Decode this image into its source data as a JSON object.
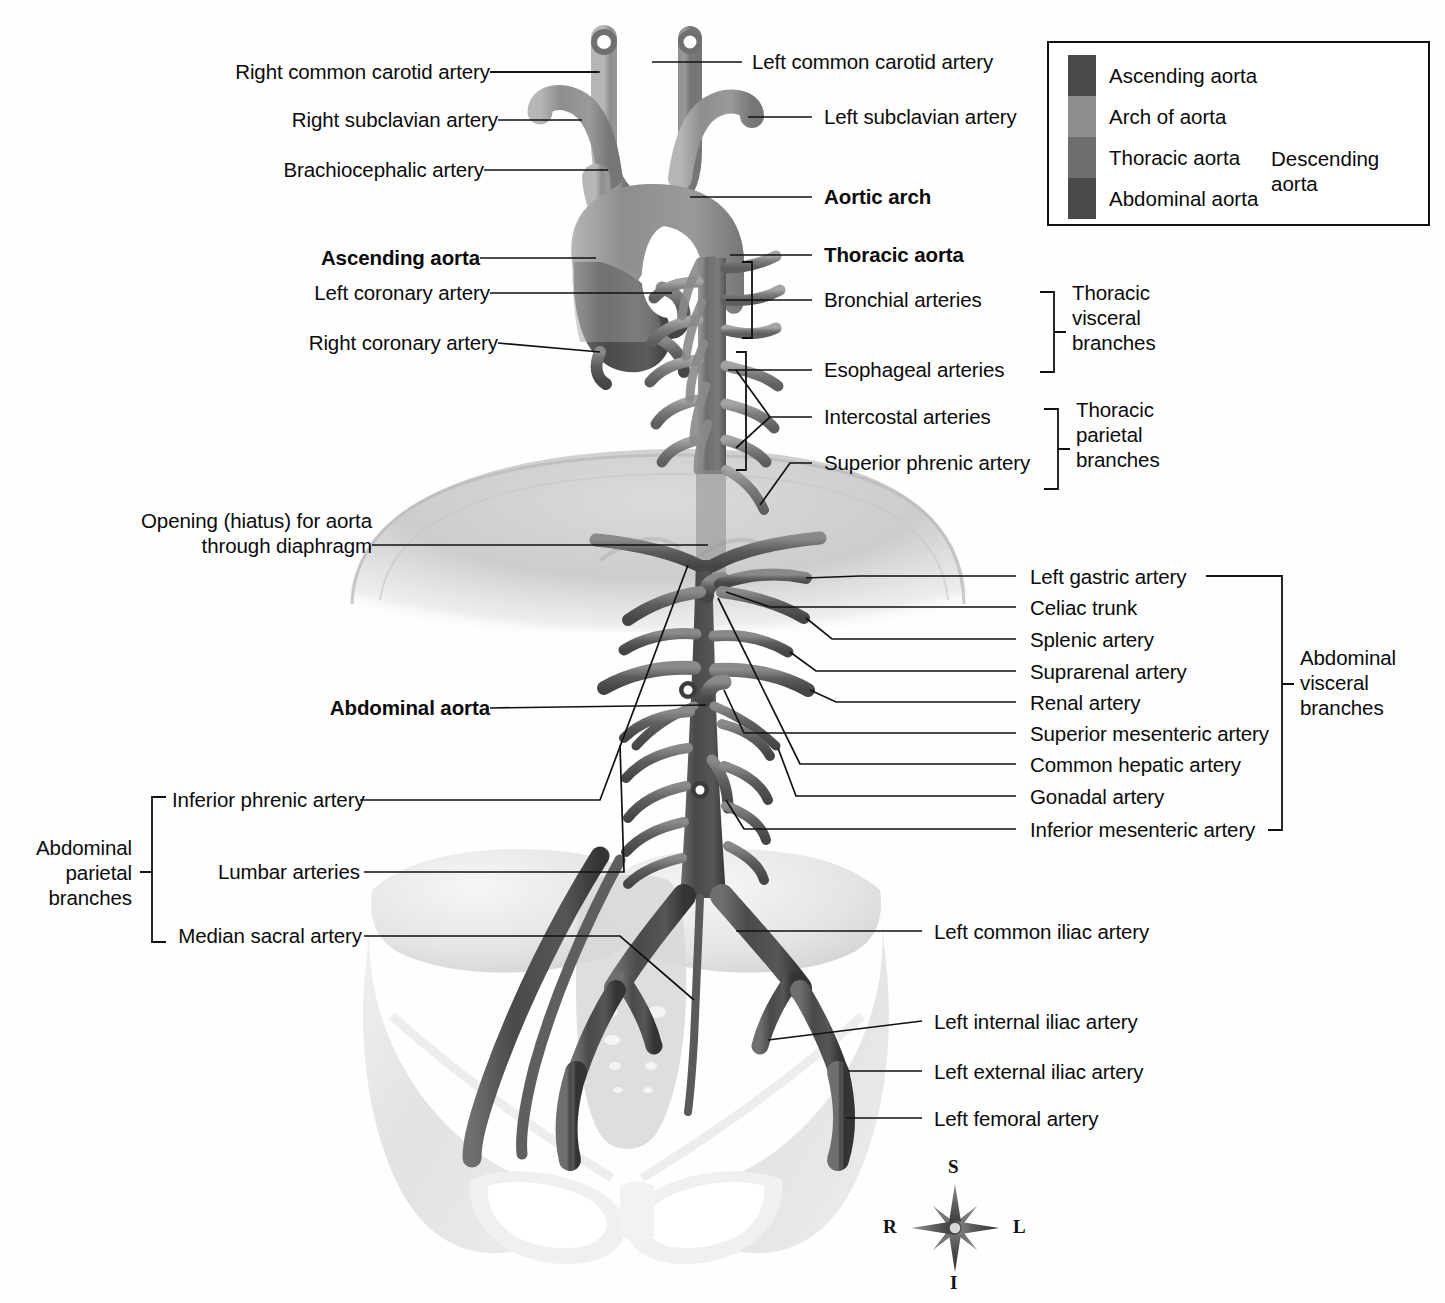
{
  "figure": {
    "background": "#fefefe",
    "ink": "#111111"
  },
  "legend": {
    "items": [
      {
        "label": "Ascending aorta",
        "color": "#4a4a4a"
      },
      {
        "label": "Arch of aorta",
        "color": "#8e8e8e"
      },
      {
        "label": "Thoracic aorta",
        "color": "#6e6e6e"
      },
      {
        "label": "Abdominal aorta",
        "color": "#4a4a4a"
      }
    ],
    "bracket_label": "Descending\naorta",
    "bracket_label_line1": "Descending",
    "bracket_label_line2": "aorta"
  },
  "labels_left": [
    {
      "id": "right-common-carotid-artery",
      "text": "Right common carotid artery",
      "bold": false
    },
    {
      "id": "right-subclavian-artery",
      "text": "Right subclavian artery",
      "bold": false
    },
    {
      "id": "brachiocephalic-artery",
      "text": "Brachiocephalic artery",
      "bold": false
    },
    {
      "id": "ascending-aorta",
      "text": "Ascending aorta",
      "bold": true
    },
    {
      "id": "left-coronary-artery",
      "text": "Left coronary artery",
      "bold": false
    },
    {
      "id": "right-coronary-artery",
      "text": "Right coronary artery",
      "bold": false
    },
    {
      "id": "opening-hiatus-line1",
      "text": "Opening (hiatus) for aorta",
      "bold": false
    },
    {
      "id": "opening-hiatus-line2",
      "text": "through diaphragm",
      "bold": false
    },
    {
      "id": "abdominal-aorta",
      "text": "Abdominal aorta",
      "bold": true
    },
    {
      "id": "inferior-phrenic-artery",
      "text": "Inferior phrenic artery",
      "bold": false
    },
    {
      "id": "lumbar-arteries",
      "text": "Lumbar arteries",
      "bold": false
    },
    {
      "id": "median-sacral-artery",
      "text": "Median sacral artery",
      "bold": false
    }
  ],
  "labels_right": [
    {
      "id": "left-common-carotid-artery",
      "text": "Left common carotid artery",
      "bold": false
    },
    {
      "id": "left-subclavian-artery",
      "text": "Left subclavian artery",
      "bold": false
    },
    {
      "id": "aortic-arch",
      "text": "Aortic arch",
      "bold": true
    },
    {
      "id": "thoracic-aorta",
      "text": "Thoracic aorta",
      "bold": true
    },
    {
      "id": "bronchial-arteries",
      "text": "Bronchial arteries",
      "bold": false
    },
    {
      "id": "esophageal-arteries",
      "text": "Esophageal arteries",
      "bold": false
    },
    {
      "id": "intercostal-arteries",
      "text": "Intercostal arteries",
      "bold": false
    },
    {
      "id": "superior-phrenic-artery",
      "text": "Superior phrenic artery",
      "bold": false
    },
    {
      "id": "left-gastric-artery",
      "text": "Left gastric artery",
      "bold": false
    },
    {
      "id": "celiac-trunk",
      "text": "Celiac trunk",
      "bold": false
    },
    {
      "id": "splenic-artery",
      "text": "Splenic artery",
      "bold": false
    },
    {
      "id": "suprarenal-artery",
      "text": "Suprarenal artery",
      "bold": false
    },
    {
      "id": "renal-artery",
      "text": "Renal artery",
      "bold": false
    },
    {
      "id": "superior-mesenteric-artery",
      "text": "Superior mesenteric artery",
      "bold": false
    },
    {
      "id": "common-hepatic-artery",
      "text": "Common hepatic artery",
      "bold": false
    },
    {
      "id": "gonadal-artery",
      "text": "Gonadal artery",
      "bold": false
    },
    {
      "id": "inferior-mesenteric-artery",
      "text": "Inferior mesenteric artery",
      "bold": false
    },
    {
      "id": "left-common-iliac-artery",
      "text": "Left common iliac artery",
      "bold": false
    },
    {
      "id": "left-internal-iliac-artery",
      "text": "Left internal iliac artery",
      "bold": false
    },
    {
      "id": "left-external-iliac-artery",
      "text": "Left external iliac artery",
      "bold": false
    },
    {
      "id": "left-femoral-artery",
      "text": "Left femoral artery",
      "bold": false
    }
  ],
  "group_brackets": [
    {
      "id": "thoracic-visceral-branches",
      "line1": "Thoracic",
      "line2": "visceral",
      "line3": "branches"
    },
    {
      "id": "thoracic-parietal-branches",
      "line1": "Thoracic",
      "line2": "parietal",
      "line3": "branches"
    },
    {
      "id": "abdominal-visceral-branches",
      "line1": "Abdominal",
      "line2": "visceral",
      "line3": "branches"
    },
    {
      "id": "abdominal-parietal-branches",
      "line1": "Abdominal",
      "line2": "parietal",
      "line3": "branches"
    }
  ],
  "compass": {
    "superior": "S",
    "inferior": "I",
    "right": "R",
    "left": "L"
  },
  "colors": {
    "ascending_aorta": "#4a4a4a",
    "arch_of_aorta": "#8e8e8e",
    "thoracic_aorta": "#6e6e6e",
    "abdominal_aorta": "#4a4a4a",
    "bone": "#e9e9e9",
    "diaphragm": "#c9c9c9",
    "line": "#111111"
  }
}
